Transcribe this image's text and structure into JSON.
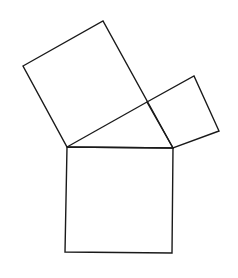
{
  "diagram": {
    "type": "pythagorean-squares",
    "canvas": {
      "width": 238,
      "height": 278,
      "background": "#ffffff"
    },
    "stroke": {
      "color": "#1a1a1a",
      "width": 1.4
    },
    "shapes": [
      {
        "name": "square-on-long-leg",
        "points": [
          [
            23,
            66
          ],
          [
            103,
            21
          ],
          [
            173,
            148
          ],
          [
            67,
            147
          ]
        ]
      },
      {
        "name": "square-on-short-leg",
        "points": [
          [
            147,
            102
          ],
          [
            194,
            76
          ],
          [
            219,
            131
          ],
          [
            173,
            148
          ]
        ]
      },
      {
        "name": "square-on-hypotenuse",
        "points": [
          [
            67,
            147
          ],
          [
            173,
            148
          ],
          [
            172,
            253
          ],
          [
            65,
            252
          ]
        ]
      },
      {
        "name": "right-triangle-hypotenuse",
        "points": [
          [
            67,
            147
          ],
          [
            147,
            102
          ]
        ]
      }
    ]
  }
}
